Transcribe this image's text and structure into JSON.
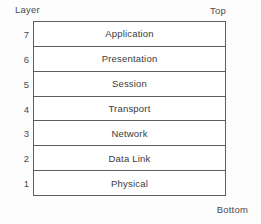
{
  "diagram": {
    "column_header": "Layer",
    "top_label": "Top",
    "bottom_label": "Bottom",
    "layers": [
      {
        "number": "7",
        "name": "Application"
      },
      {
        "number": "6",
        "name": "Presentation"
      },
      {
        "number": "5",
        "name": "Session"
      },
      {
        "number": "4",
        "name": "Transport"
      },
      {
        "number": "3",
        "name": "Network"
      },
      {
        "number": "2",
        "name": "Data Link"
      },
      {
        "number": "1",
        "name": "Physical"
      }
    ],
    "colors": {
      "background": "#fdfdfd",
      "box_background": "#ffffff",
      "border": "#5e5e5e",
      "text": "#3a3a3a"
    }
  }
}
